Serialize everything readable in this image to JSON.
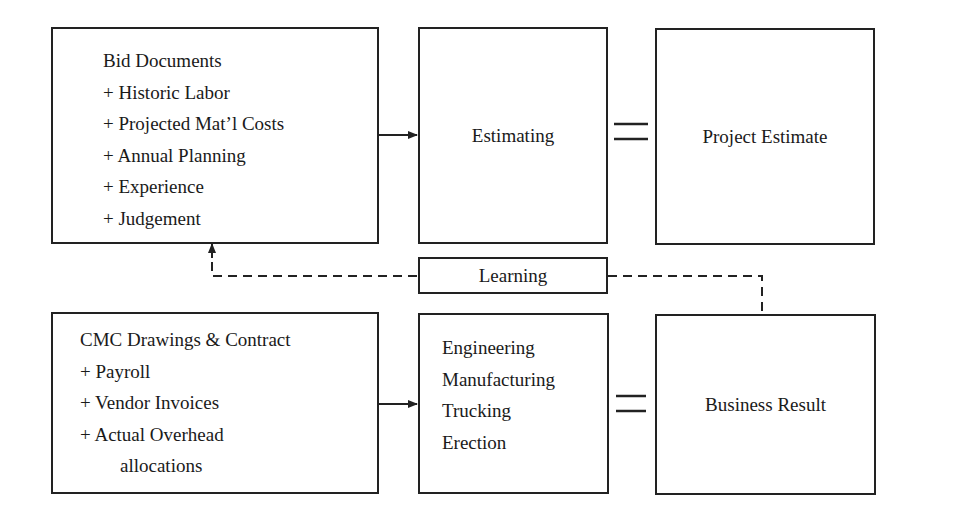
{
  "diagram": {
    "top_row": {
      "inputs_box": {
        "lines": [
          "Bid Documents",
          "+ Historic Labor",
          "+ Projected Mat’l Costs",
          "+ Annual Planning",
          "+ Experience",
          "+ Judgement"
        ]
      },
      "process_box": {
        "label": "Estimating"
      },
      "equals_symbol": "=",
      "result_box": {
        "label": "Project Estimate"
      }
    },
    "feedback": {
      "label": "Learning",
      "style": "dashed"
    },
    "bottom_row": {
      "inputs_box": {
        "lines": [
          "CMC Drawings & Contract",
          "+ Payroll",
          "+ Vendor Invoices",
          "+ Actual Overhead",
          "allocations"
        ]
      },
      "process_box": {
        "lines": [
          "Engineering",
          "Manufacturing",
          "Trucking",
          "Erection"
        ]
      },
      "equals_symbol": "=",
      "result_box": {
        "label": "Business Result"
      }
    },
    "colors": {
      "line": "#222222",
      "background": "#ffffff"
    }
  }
}
